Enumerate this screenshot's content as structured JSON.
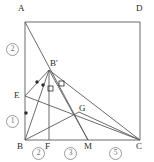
{
  "figure": {
    "type": "geometry-diagram",
    "stroke_color": "#5a5a5a",
    "label_color": "#2b2b2b",
    "circle_label_color": "#6f6f6f",
    "background": "#ffffff",
    "view": {
      "width": 154,
      "height": 162
    },
    "points": [
      {
        "name": "A",
        "label": "A",
        "x": 25,
        "y": 22,
        "lx": 18,
        "ly": 4
      },
      {
        "name": "D",
        "label": "D",
        "x": 140,
        "y": 22,
        "lx": 136,
        "ly": 4
      },
      {
        "name": "B",
        "label": "B",
        "x": 25,
        "y": 140,
        "lx": 17,
        "ly": 142
      },
      {
        "name": "C",
        "label": "C",
        "x": 140,
        "y": 140,
        "lx": 136,
        "ly": 142
      },
      {
        "name": "E",
        "label": "E",
        "x": 25,
        "y": 96,
        "lx": 14,
        "ly": 91
      },
      {
        "name": "F",
        "label": "F",
        "x": 49,
        "y": 140,
        "lx": 45,
        "ly": 142
      },
      {
        "name": "M",
        "label": "M",
        "x": 88,
        "y": 140,
        "lx": 84,
        "ly": 142
      },
      {
        "name": "G",
        "label": "G",
        "x": 79,
        "y": 112,
        "lx": 79,
        "ly": 104
      },
      {
        "name": "Bp",
        "label": "B'",
        "x": 49,
        "y": 70,
        "lx": 50,
        "ly": 59
      }
    ],
    "segments": [
      {
        "name": "side-AD",
        "from": "A",
        "to": "D"
      },
      {
        "name": "side-AB",
        "from": "A",
        "to": "B"
      },
      {
        "name": "side-BC",
        "from": "B",
        "to": "C"
      },
      {
        "name": "side-DC",
        "from": "D",
        "to": "C"
      },
      {
        "name": "A-to-M",
        "from": "A",
        "to": "M"
      },
      {
        "name": "Bp-to-F",
        "from": "Bp",
        "to": "F"
      },
      {
        "name": "Bp-to-B",
        "from": "Bp",
        "to": "B"
      },
      {
        "name": "Bp-to-E",
        "from": "Bp",
        "to": "E"
      },
      {
        "name": "Bp-to-C",
        "from": "Bp",
        "to": "C"
      },
      {
        "name": "Bp-to-M",
        "from": "Bp",
        "to": "M"
      },
      {
        "name": "E-to-C",
        "from": "E",
        "to": "C"
      },
      {
        "name": "B-to-G",
        "from": "B",
        "to": "G"
      },
      {
        "name": "G-to-C",
        "from": "G",
        "to": "C"
      }
    ],
    "tick_marks": [
      {
        "name": "tick-on-EBp-1",
        "x": 37,
        "y": 82
      },
      {
        "name": "tick-on-EBp-2",
        "x": 43,
        "y": 85
      },
      {
        "name": "tick-on-EB",
        "x": 26,
        "y": 113
      }
    ],
    "right_angle_marks": [
      {
        "name": "right-angle-left",
        "x": 48,
        "y": 86
      },
      {
        "name": "right-angle-right",
        "x": 59,
        "y": 81
      }
    ],
    "circled_labels": [
      {
        "name": "circled-2-left",
        "text": "2",
        "x": 6,
        "y": 43
      },
      {
        "name": "circled-1-left",
        "text": "1",
        "x": 6,
        "y": 115
      },
      {
        "name": "circled-2-bottom",
        "text": "2",
        "x": 32,
        "y": 147
      },
      {
        "name": "circled-3-bottom",
        "text": "3",
        "x": 64,
        "y": 147
      },
      {
        "name": "circled-5-bottom",
        "text": "5",
        "x": 109,
        "y": 147
      }
    ]
  }
}
